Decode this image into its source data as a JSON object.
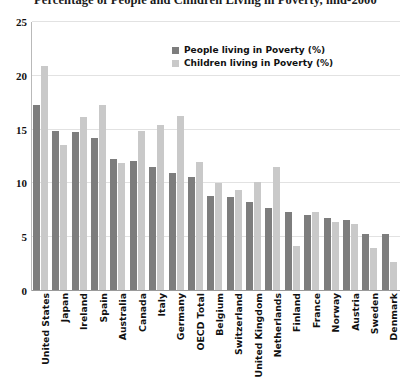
{
  "chart_data": {
    "type": "bar",
    "title": "Percentage of People and Children Living in Poverty, mid-2000",
    "xlabel": "",
    "ylabel": "",
    "ylim": [
      0,
      25
    ],
    "yticks": [
      0,
      5,
      10,
      15,
      20,
      25
    ],
    "grid": true,
    "legend_position": "upper-center",
    "colors": {
      "people": "#7d7d7d",
      "children": "#c9c9c9",
      "gridline": "#e2e2e2",
      "axis": "#9a9a9a",
      "text": "#111111"
    },
    "categories": [
      "United States",
      "Japan",
      "Ireland",
      "Spain",
      "Australia",
      "Canada",
      "Italy",
      "Germany",
      "OECD Total",
      "Belgium",
      "Switzerland",
      "United Kingdom",
      "Netherlands",
      "Finland",
      "France",
      "Norway",
      "Austria",
      "Sweden",
      "Denmark"
    ],
    "series": [
      {
        "name": "People living in Poverty (%)",
        "color": "#7d7d7d",
        "values": [
          17.3,
          14.9,
          14.8,
          14.2,
          12.3,
          12.1,
          11.5,
          11.0,
          10.6,
          8.8,
          8.7,
          8.3,
          7.7,
          7.3,
          7.1,
          6.8,
          6.6,
          5.3,
          5.3
        ]
      },
      {
        "name": "Children living in Poverty (%)",
        "color": "#c9c9c9",
        "values": [
          20.9,
          13.6,
          16.2,
          17.3,
          11.9,
          14.9,
          15.4,
          16.3,
          12.0,
          10.0,
          9.4,
          10.1,
          11.5,
          4.2,
          7.3,
          6.4,
          6.2,
          4.0,
          2.7
        ]
      }
    ]
  },
  "legend": {
    "items": [
      {
        "label": "People living in Poverty (%)",
        "color": "#7d7d7d"
      },
      {
        "label": "Children living in Poverty (%)",
        "color": "#c9c9c9"
      }
    ]
  }
}
